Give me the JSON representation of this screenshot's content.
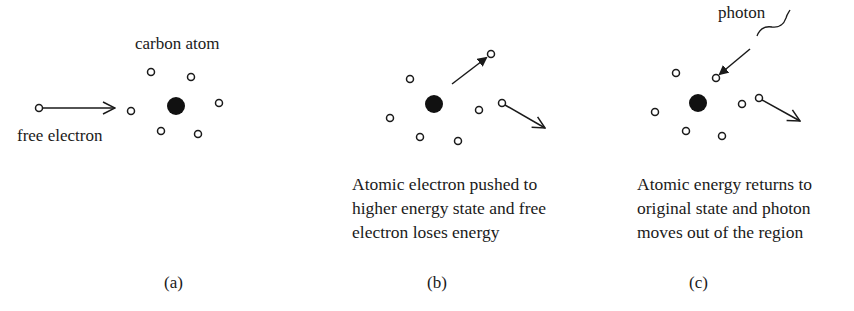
{
  "colors": {
    "ink": "#1a1a1a",
    "background": "#ffffff"
  },
  "panels": [
    {
      "id": "a",
      "letter": "(a)",
      "labels": {
        "atom": "carbon atom",
        "incoming": "free electron"
      },
      "nucleus": {
        "x": 176,
        "y": 106,
        "r": 9
      },
      "electrons": [
        [
          131,
          111
        ],
        [
          151,
          72
        ],
        [
          191,
          77
        ],
        [
          219,
          103
        ],
        [
          161,
          131
        ],
        [
          198,
          134
        ]
      ],
      "free_electron": {
        "x": 39,
        "y": 108
      },
      "arrows": [
        {
          "from": [
            44,
            108
          ],
          "to": [
            115,
            108
          ],
          "head": "open"
        }
      ]
    },
    {
      "id": "b",
      "letter": "(b)",
      "caption": [
        "Atomic electron pushed to",
        "higher energy state and free",
        "electron loses energy"
      ],
      "nucleus": {
        "x": 434,
        "y": 104,
        "r": 9
      },
      "electrons": [
        [
          410,
          79
        ],
        [
          390,
          118
        ],
        [
          420,
          137
        ],
        [
          458,
          141
        ],
        [
          479,
          110
        ],
        [
          491,
          54
        ],
        [
          502,
          103
        ]
      ],
      "arrows": [
        {
          "from": [
            452,
            84
          ],
          "to": [
            487,
            57
          ],
          "head": "filled"
        },
        {
          "from": [
            506,
            106
          ],
          "to": [
            545,
            128
          ],
          "head": "open"
        }
      ]
    },
    {
      "id": "c",
      "letter": "(c)",
      "labels": {
        "photon": "photon"
      },
      "caption": [
        "Atomic energy returns to",
        "original state and photon",
        "moves out of the region"
      ],
      "nucleus": {
        "x": 698,
        "y": 103,
        "r": 9
      },
      "electrons": [
        [
          676,
          73
        ],
        [
          655,
          112
        ],
        [
          686,
          131
        ],
        [
          722,
          136
        ],
        [
          742,
          104
        ],
        [
          716,
          78
        ],
        [
          759,
          98
        ]
      ],
      "arrows": [
        {
          "from": [
            750,
            49
          ],
          "to": [
            718,
            76
          ],
          "head": "filled"
        },
        {
          "from": [
            763,
            101
          ],
          "to": [
            800,
            121
          ],
          "head": "open"
        }
      ]
    }
  ]
}
